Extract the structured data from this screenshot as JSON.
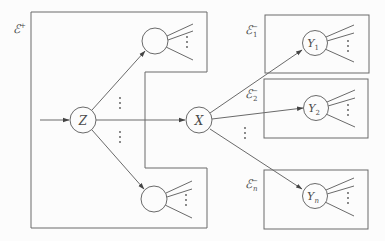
{
  "diagram": {
    "type": "graph-partition",
    "colors": {
      "background": "#fcfcfc",
      "stroke": "#6a6a6a",
      "text": "#4a4a4a"
    },
    "regions": [
      {
        "id": "E_plus",
        "label": "ℰ",
        "sup": "+",
        "sub": ""
      },
      {
        "id": "E1_minus",
        "label": "ℰ",
        "sup": "−",
        "sub": "1"
      },
      {
        "id": "E2_minus",
        "label": "ℰ",
        "sup": "−",
        "sub": "2"
      },
      {
        "id": "En_minus",
        "label": "ℰ",
        "sup": "−",
        "sub": "n"
      }
    ],
    "nodes": [
      {
        "id": "Z",
        "label": "Z",
        "sub": ""
      },
      {
        "id": "X",
        "label": "X",
        "sub": ""
      },
      {
        "id": "top",
        "label": "",
        "sub": ""
      },
      {
        "id": "bottom",
        "label": "",
        "sub": ""
      },
      {
        "id": "Y1",
        "label": "Y",
        "sub": "1"
      },
      {
        "id": "Y2",
        "label": "Y",
        "sub": "2"
      },
      {
        "id": "Yn",
        "label": "Y",
        "sub": "n"
      }
    ],
    "edges": [
      {
        "from": "input",
        "to": "Z"
      },
      {
        "from": "Z",
        "to": "top"
      },
      {
        "from": "Z",
        "to": "X"
      },
      {
        "from": "Z",
        "to": "bottom"
      },
      {
        "from": "X",
        "to": "Y1"
      },
      {
        "from": "X",
        "to": "Y2"
      },
      {
        "from": "X",
        "to": "Yn"
      }
    ],
    "ellipsis": "⋮"
  }
}
